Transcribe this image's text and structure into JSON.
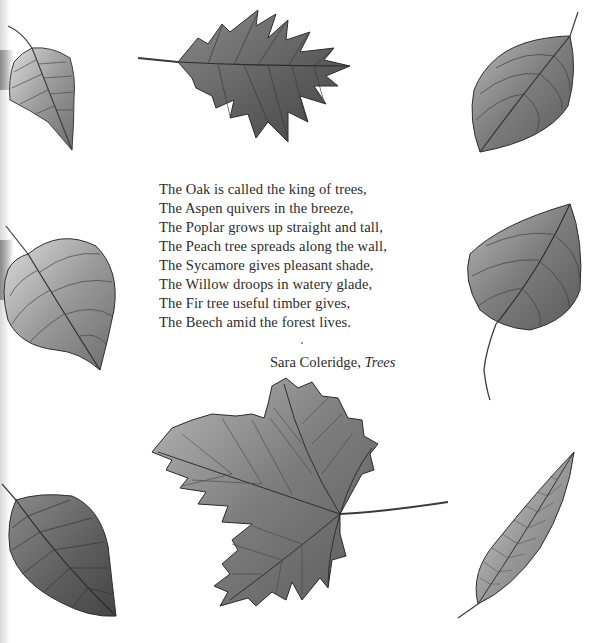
{
  "poem": {
    "lines": [
      "The Oak is called the king of trees,",
      "The Aspen quivers in the breeze,",
      "The Poplar grows up straight and tall,",
      "The Peach tree spreads along the wall,",
      "The Sycamore gives pleasant shade,",
      "The Willow droops in watery glade,",
      "The Fir tree useful timber gives,",
      "The Beech amid the forest lives."
    ],
    "author": "Sara Coleridge,",
    "title": "Trees"
  },
  "illustrations": [
    {
      "name": "birch-leaf-illustration",
      "position": "top-left"
    },
    {
      "name": "oak-leaf-illustration",
      "position": "top-center"
    },
    {
      "name": "dogwood-leaf-illustration",
      "position": "top-right"
    },
    {
      "name": "lime-leaf-illustration",
      "position": "middle-left"
    },
    {
      "name": "poplar-leaf-illustration",
      "position": "middle-right"
    },
    {
      "name": "beech-leaf-illustration",
      "position": "bottom-left"
    },
    {
      "name": "sycamore-leaf-illustration",
      "position": "bottom-center"
    },
    {
      "name": "willow-leaf-illustration",
      "position": "bottom-right"
    }
  ],
  "colors": {
    "background": "#ffffff",
    "text": "#2c2c2c",
    "leaf_fill": "#8c8c8c",
    "leaf_dark": "#4a4a4a",
    "leaf_light": "#c4c4c4"
  }
}
